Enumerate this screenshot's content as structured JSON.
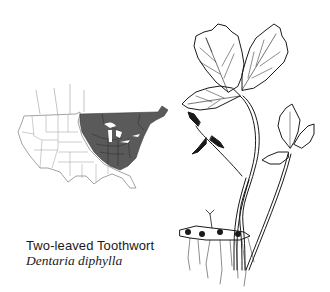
{
  "caption": {
    "common_name": "Two-leaved Toothwort",
    "scientific_name": "Dentaria diphylla"
  },
  "map": {
    "region": "United States and southern Canada",
    "shaded_range": "Northeastern North America (Great Lakes to Atlantic)",
    "shade_color": "#5a5a5a",
    "outline_color": "#8a8a8a"
  },
  "illustration": {
    "subject": "Two-leaved Toothwort plant with rhizome and roots",
    "line_color": "#1a1a1a"
  }
}
